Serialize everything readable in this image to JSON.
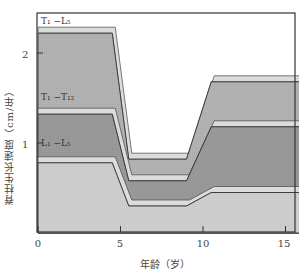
{
  "chart_data": {
    "type": "area",
    "title": "",
    "xlabel": "年龄（岁）",
    "ylabel": "脊柱生长速度（cm/年）",
    "xlim": [
      0,
      16
    ],
    "ylim": [
      0,
      2.4
    ],
    "xticks": [
      0,
      5,
      10,
      15
    ],
    "xtick_labels": [
      "0",
      "5",
      "10",
      "15"
    ],
    "yticks": [
      1,
      2
    ],
    "ytick_labels": [
      "1",
      "2"
    ],
    "grid": false,
    "legend": "inline labels",
    "x": [
      0,
      4.5,
      5.5,
      9,
      10.5,
      16
    ],
    "series": [
      {
        "name": "L1-L5",
        "label": "L₁-L₅",
        "values": [
          0.78,
          0.78,
          0.3,
          0.3,
          0.45,
          0.45
        ],
        "color": "#cfcfcf"
      },
      {
        "name": "T1-T12",
        "label": "T₁-T₁₂",
        "values": [
          1.32,
          1.32,
          0.58,
          0.58,
          1.18,
          1.18
        ],
        "color": "#9a9a9a"
      },
      {
        "name": "T1-L5",
        "label": "T₁-L₅",
        "values": [
          2.22,
          2.22,
          0.82,
          0.82,
          1.68,
          1.68
        ],
        "color": "#b3b3b3"
      }
    ]
  },
  "labels": {
    "series_t1_l5": "T₁ −L₅",
    "series_t1_t12": "T₁ −T₁₂",
    "series_l1_l5": "L₁ −L₅"
  }
}
